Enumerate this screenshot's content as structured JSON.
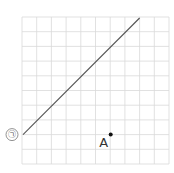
{
  "diagram": {
    "grid": {
      "columns": 10,
      "rows": 10,
      "left": 22,
      "top": 17,
      "cell": 14.7,
      "line_color": "#d9d9d9"
    },
    "line": {
      "label": "㉠",
      "start_cell": [
        0,
        8
      ],
      "end_cell": [
        8,
        0
      ],
      "color": "#555555"
    },
    "point": {
      "label": "A",
      "cell": [
        6,
        8
      ],
      "color": "#111111"
    }
  }
}
